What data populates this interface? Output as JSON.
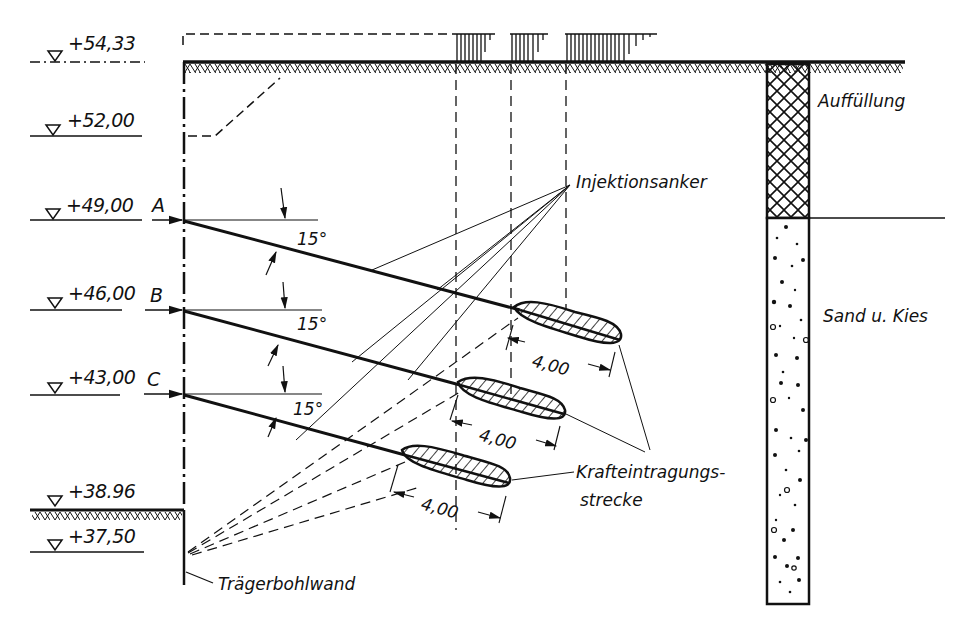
{
  "diagram": {
    "type": "engineering-cross-section",
    "elevations": [
      {
        "label": "+54,33",
        "y": 62
      },
      {
        "label": "+52,00",
        "y": 136
      },
      {
        "label": "+49,00",
        "y": 218
      },
      {
        "label": "+46,00",
        "y": 310
      },
      {
        "label": "+43,00",
        "y": 393
      },
      {
        "label": "+38.96",
        "y": 508
      },
      {
        "label": "+37,50",
        "y": 553
      }
    ],
    "anchor_rows": [
      {
        "id": "A",
        "angle_label": "15°",
        "bond_length": "4,00"
      },
      {
        "id": "B",
        "angle_label": "15°",
        "bond_length": "4,00"
      },
      {
        "id": "C",
        "angle_label": "15°",
        "bond_length": "4,00"
      }
    ],
    "labels": {
      "injection_anchor": "Injektionsanker",
      "force_transfer_line1": "Krafteintragungs-",
      "force_transfer_line2": "strecke",
      "wall": "Trägerbohlwand",
      "fill_layer": "Auffüllung",
      "sand_gravel_layer": "Sand u. Kies"
    },
    "colors": {
      "ink": "#111111",
      "paper": "#ffffff"
    }
  }
}
